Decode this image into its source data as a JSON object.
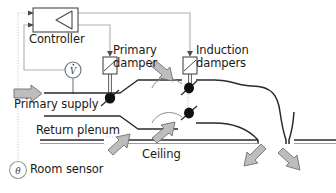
{
  "figure": {
    "type": "schematic-diagram",
    "background_color": "#ffffff",
    "line_color": "#1a1a1a",
    "control_line_color": "#9a9a9a",
    "arrow_fill_color": "#b5b5b5",
    "arrow_stroke_color": "#6b6b6b",
    "sensor_line_color": "#c3c3c3"
  },
  "labels": {
    "controller": "Controller",
    "primary_damper_line1": "Primary",
    "primary_damper_line2": "damper",
    "induction_dampers_line1": "Induction",
    "induction_dampers_line2": "dampers",
    "primary_supply": "Primary supply",
    "return_plenum": "Return plenum",
    "ceiling": "Ceiling",
    "room_sensor": "Room sensor"
  },
  "symbols": {
    "flow_meter": "V̇",
    "room_sensor": "θ"
  },
  "components": [
    {
      "name": "controller-box",
      "label": "Controller",
      "shape": "rectangle-with-left-pointing-triangle",
      "inputs": 2
    },
    {
      "name": "flow-meter",
      "label": "V̇",
      "shape": "circle"
    },
    {
      "name": "primary-damper-actuator",
      "shape": "rectangle-with-diagonal"
    },
    {
      "name": "primary-damper-blade",
      "shape": "filled-ellipse-with-diagonal"
    },
    {
      "name": "induction-damper-actuator",
      "shape": "rectangle-with-diagonal"
    },
    {
      "name": "induction-damper-blade-upper",
      "shape": "filled-ellipse-with-diagonal"
    },
    {
      "name": "induction-damper-blade-lower",
      "shape": "filled-ellipse-with-diagonal"
    },
    {
      "name": "ceiling-line",
      "shape": "double-horizontal-line"
    },
    {
      "name": "room-sensor",
      "label": "θ",
      "shape": "circle"
    }
  ],
  "flow_arrows": [
    {
      "name": "primary-supply-arrow",
      "direction": "right"
    },
    {
      "name": "induced-air-arrow-upper",
      "direction": "down-right"
    },
    {
      "name": "induced-air-arrow-lower",
      "direction": "up-right"
    },
    {
      "name": "return-air-arrow",
      "direction": "up-right"
    },
    {
      "name": "discharge-arrow-left",
      "direction": "down-left"
    },
    {
      "name": "discharge-arrow-right",
      "direction": "down-right"
    }
  ]
}
